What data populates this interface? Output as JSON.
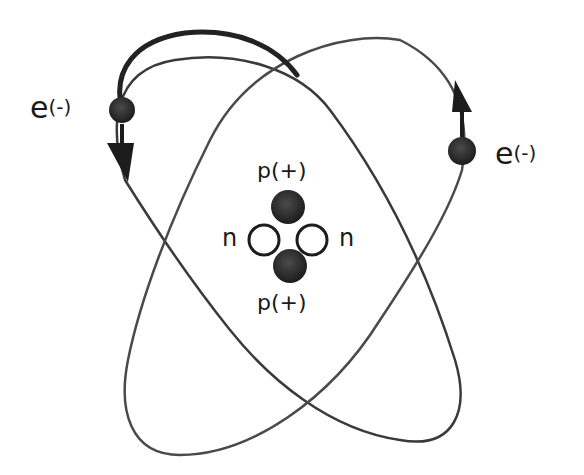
{
  "diagram": {
    "type": "atom-model",
    "colors": {
      "background": "#ffffff",
      "orbit_stroke": "#3a3a3a",
      "particle_fill": "#262626",
      "text": "#1a1a1a"
    },
    "electrons": [
      {
        "label_symbol": "e",
        "label_charge": "(-)",
        "position": "upper-left",
        "direction": "down"
      },
      {
        "label_symbol": "e",
        "label_charge": "(-)",
        "position": "right",
        "direction": "up"
      }
    ],
    "nucleus": {
      "protons": [
        {
          "label": "p(+)",
          "position": "top"
        },
        {
          "label": "p(+)",
          "position": "bottom"
        }
      ],
      "neutrons": [
        {
          "label": "n",
          "position": "left"
        },
        {
          "label": "n",
          "position": "right"
        }
      ]
    },
    "orbits": 2
  }
}
